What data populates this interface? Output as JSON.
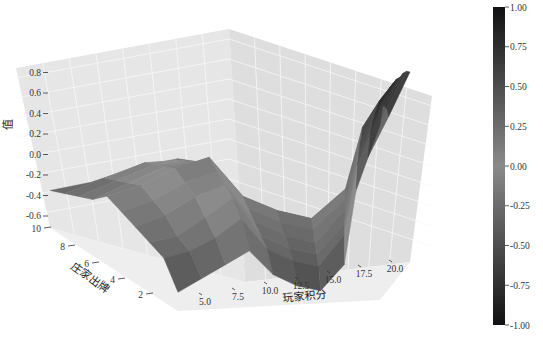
{
  "chart_data": {
    "type": "surface3d",
    "title": "",
    "xlabel": "玩家积分",
    "ylabel": "庄家出牌",
    "zlabel": "值",
    "x_ticks": [
      "5.0",
      "7.5",
      "10.0",
      "12.5",
      "15.0",
      "17.5",
      "20.0"
    ],
    "y_ticks": [
      "2",
      "4",
      "6",
      "8",
      "10"
    ],
    "z_ticks": [
      "-0.6",
      "-0.4",
      "-0.2",
      "0.0",
      "0.2",
      "0.4",
      "0.6",
      "0.8"
    ],
    "xlim": [
      4,
      21
    ],
    "ylim": [
      1,
      10
    ],
    "zlim": [
      -0.7,
      0.9
    ],
    "grid": true,
    "colormap": "grayscale",
    "colorbar": {
      "ticks": [
        "1.00",
        "0.75",
        "0.50",
        "0.25",
        "0.00",
        "-0.25",
        "-0.50",
        "-0.75",
        "-1.00"
      ],
      "range": [
        -1.0,
        1.0
      ]
    },
    "player_sum": [
      4,
      6,
      8,
      10,
      12,
      14,
      16,
      18,
      19,
      20,
      21
    ],
    "dealer_card": [
      1,
      2,
      3,
      4,
      5,
      6,
      7,
      8,
      9,
      10
    ],
    "z_values": [
      [
        -0.55,
        -0.45,
        -0.35,
        -0.25,
        -0.45,
        -0.55,
        -0.6,
        -0.4,
        0.2,
        0.45,
        0.7
      ],
      [
        -0.35,
        -0.3,
        -0.2,
        -0.05,
        -0.3,
        -0.4,
        -0.45,
        -0.2,
        0.35,
        0.6,
        0.85
      ],
      [
        -0.3,
        -0.25,
        -0.1,
        0.05,
        -0.25,
        -0.35,
        -0.4,
        -0.15,
        0.4,
        0.65,
        0.88
      ],
      [
        -0.25,
        -0.15,
        0.0,
        0.1,
        -0.2,
        -0.3,
        -0.35,
        -0.1,
        0.45,
        0.68,
        0.9
      ],
      [
        -0.2,
        -0.1,
        0.05,
        0.15,
        -0.15,
        -0.25,
        -0.3,
        -0.05,
        0.45,
        0.7,
        0.9
      ],
      [
        -0.15,
        -0.05,
        0.1,
        0.2,
        -0.1,
        -0.2,
        -0.25,
        0.0,
        0.5,
        0.72,
        0.9
      ],
      [
        -0.25,
        -0.1,
        0.05,
        0.1,
        -0.2,
        -0.35,
        -0.4,
        -0.1,
        0.4,
        0.65,
        0.88
      ],
      [
        -0.3,
        -0.15,
        0.0,
        0.05,
        -0.3,
        -0.45,
        -0.5,
        -0.2,
        0.3,
        0.6,
        0.88
      ],
      [
        -0.35,
        -0.2,
        -0.05,
        0.0,
        -0.35,
        -0.5,
        -0.55,
        -0.3,
        0.2,
        0.55,
        0.86
      ],
      [
        -0.4,
        -0.3,
        -0.15,
        -0.05,
        -0.4,
        -0.55,
        -0.6,
        -0.4,
        0.1,
        0.45,
        0.82
      ]
    ]
  }
}
